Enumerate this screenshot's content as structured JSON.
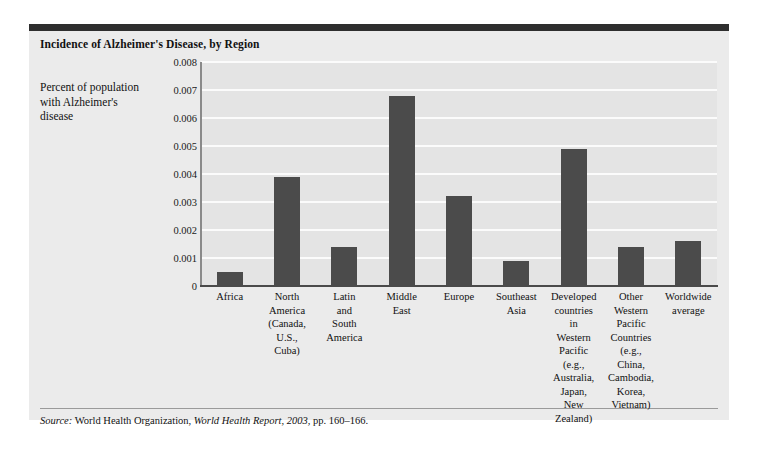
{
  "figure": {
    "title": "Incidence of Alzheimer's Disease, by Region",
    "ylabel": "Percent of population with Alzheimer's disease",
    "source_prefix": "Source:",
    "source_publisher": "World Health Organization,",
    "source_work": "World Health Report, 2003",
    "source_pages": ", pp. 160–166.",
    "bar_color": "#4b4b4b",
    "background_color": "#ebebeb",
    "plot_background_color": "#e4e4e4",
    "gridline_color": "#fbfbfb"
  },
  "chart_data": {
    "type": "bar",
    "title": "Incidence of Alzheimer's Disease, by Region",
    "xlabel": "",
    "ylabel": "Percent of population with Alzheimer's disease",
    "ylim": [
      0,
      0.008
    ],
    "yticks": [
      "0",
      "0.001",
      "0.002",
      "0.003",
      "0.004",
      "0.005",
      "0.006",
      "0.007",
      "0.008"
    ],
    "ytick_values": [
      0,
      0.001,
      0.002,
      0.003,
      0.004,
      0.005,
      0.006,
      0.007,
      0.008
    ],
    "grid": true,
    "legend": "none",
    "categories": [
      "Africa",
      "North America (Canada, U.S., Cuba)",
      "Latin and South America",
      "Middle East",
      "Europe",
      "Southeast Asia",
      "Developed countries in Western Pacific (e.g., Australia, Japan, New Zealand)",
      "Other Western Pacific Countries (e.g., China, Cambodia, Korea, Vietnam)",
      "Worldwide average"
    ],
    "category_lines": [
      [
        "Africa"
      ],
      [
        "North",
        "America",
        "(Canada,",
        "U.S.,",
        "Cuba)"
      ],
      [
        "Latin",
        "and",
        "South",
        "America"
      ],
      [
        "Middle",
        "East"
      ],
      [
        "Europe"
      ],
      [
        "Southeast",
        "Asia"
      ],
      [
        "Developed",
        "countries",
        "in",
        "Western",
        "Pacific",
        "(e.g.,",
        "Australia,",
        "Japan,",
        "New",
        "Zealand)"
      ],
      [
        "Other",
        "Western",
        "Pacific",
        "Countries",
        "(e.g.,",
        "China,",
        "Cambodia,",
        "Korea,",
        "Vietnam)"
      ],
      [
        "Worldwide",
        "average"
      ]
    ],
    "values": [
      0.0005,
      0.0039,
      0.0014,
      0.0068,
      0.0032,
      0.0009,
      0.0049,
      0.0014,
      0.0016
    ]
  }
}
